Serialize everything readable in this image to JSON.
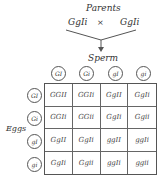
{
  "title": "Parents",
  "parents": {
    "left": "GgIi",
    "cross": "×",
    "right": "GgIi"
  },
  "sperm_label": "Sperm",
  "eggs_label": "Eggs",
  "sperm_gametes": [
    "GI",
    "Gi",
    "gI",
    "gi"
  ],
  "egg_gametes": [
    "GI",
    "Gi",
    "gI",
    "gi"
  ],
  "punnett": [
    [
      "GGII",
      "GGIi",
      "GgII",
      "GgIi"
    ],
    [
      "GGIi",
      "GGii",
      "GgIi",
      "Ggii"
    ],
    [
      "GgII",
      "GgIi",
      "ggII",
      "ggIi"
    ],
    [
      "GgIi",
      "Ggii",
      "ggIi",
      "ggii"
    ]
  ]
}
